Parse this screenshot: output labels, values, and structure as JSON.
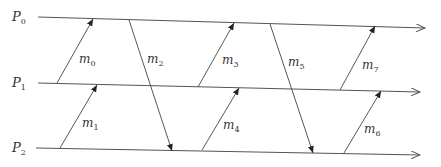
{
  "diagram": {
    "type": "space-time message diagram",
    "processes": [
      {
        "id": "P0",
        "label": "P",
        "sub": "0",
        "x1": 38,
        "y1": 17,
        "x2": 425,
        "y2": 28,
        "label_x": 12,
        "label_y": 21
      },
      {
        "id": "P1",
        "label": "P",
        "sub": "1",
        "x1": 38,
        "y1": 83,
        "x2": 420,
        "y2": 92,
        "label_x": 12,
        "label_y": 87
      },
      {
        "id": "P2",
        "label": "P",
        "sub": "2",
        "x1": 36,
        "y1": 148,
        "x2": 420,
        "y2": 155,
        "label_x": 12,
        "label_y": 152
      }
    ],
    "messages": [
      {
        "id": "m0",
        "label": "m",
        "sub": "0",
        "from": "P1",
        "to": "P0",
        "x1": 57,
        "y1": 83,
        "x2": 93,
        "y2": 19,
        "label_x": 79,
        "label_y": 63
      },
      {
        "id": "m1",
        "label": "m",
        "sub": "1",
        "from": "P2",
        "to": "P1",
        "x1": 60,
        "y1": 148,
        "x2": 97,
        "y2": 85,
        "label_x": 82,
        "label_y": 127
      },
      {
        "id": "m2",
        "label": "m",
        "sub": "2",
        "from": "P0",
        "to": "P2",
        "x1": 129,
        "y1": 20,
        "x2": 172,
        "y2": 151,
        "label_x": 147,
        "label_y": 63
      },
      {
        "id": "m3",
        "label": "m",
        "sub": "3",
        "from": "P1",
        "to": "P0",
        "x1": 198,
        "y1": 87,
        "x2": 234,
        "y2": 23,
        "label_x": 222,
        "label_y": 64
      },
      {
        "id": "m4",
        "label": "m",
        "sub": "4",
        "from": "P2",
        "to": "P1",
        "x1": 202,
        "y1": 150,
        "x2": 239,
        "y2": 88,
        "label_x": 223,
        "label_y": 129
      },
      {
        "id": "m5",
        "label": "m",
        "sub": "5",
        "from": "P0",
        "to": "P2",
        "x1": 270,
        "y1": 24,
        "x2": 313,
        "y2": 153,
        "label_x": 288,
        "label_y": 66
      },
      {
        "id": "m6",
        "label": "m",
        "sub": "6",
        "from": "P2",
        "to": "P1",
        "x1": 344,
        "y1": 153,
        "x2": 381,
        "y2": 91,
        "label_x": 364,
        "label_y": 133
      },
      {
        "id": "m7",
        "label": "m",
        "sub": "7",
        "from": "P1",
        "to": "P0",
        "x1": 340,
        "y1": 90,
        "x2": 375,
        "y2": 26,
        "label_x": 362,
        "label_y": 69
      }
    ],
    "colors": {
      "line": "#555555",
      "text": "#333333",
      "background": "#ffffff"
    }
  }
}
